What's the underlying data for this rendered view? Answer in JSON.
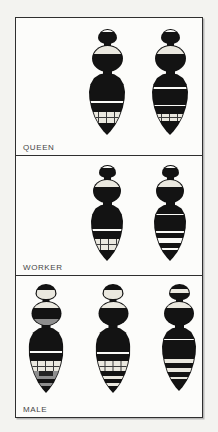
{
  "figure_caption": "Bumblebee caste colour-pattern plate",
  "colors": {
    "page_bg": "#f3f3f0",
    "panel_bg": "#fcfcfa",
    "border": "#2f2f2f",
    "label": "#454545",
    "ink": "#131313",
    "white_band": "#fafaf7",
    "pale_band": "#eae8df",
    "gray_band": "#8e8e8e",
    "grid_line": "#3a3a3a"
  },
  "panels": [
    {
      "label": "QUEEN",
      "bees": [
        {
          "name": "queen-left-bee",
          "cx": 91,
          "top": 11,
          "head": {
            "w": 19,
            "h": 15,
            "bands": [
              [
                "white",
                15
              ],
              [
                "black",
                85
              ]
            ]
          },
          "thorax": {
            "w": 31,
            "h": 27,
            "bands": [
              [
                "pale",
                30
              ],
              [
                "black",
                70
              ]
            ]
          },
          "abdomen": {
            "w": 36,
            "h": 62,
            "bands": [
              [
                "black",
                45
              ],
              [
                "white",
                4
              ],
              [
                "black",
                14
              ],
              [
                "palegrid",
                19
              ],
              [
                "black",
                18
              ]
            ]
          }
        },
        {
          "name": "queen-right-bee",
          "cx": 154,
          "top": 11,
          "head": {
            "w": 19,
            "h": 15,
            "bands": [
              [
                "white",
                16
              ],
              [
                "black",
                84
              ]
            ]
          },
          "thorax": {
            "w": 31,
            "h": 27,
            "bands": [
              [
                "pale",
                30
              ],
              [
                "black",
                70
              ]
            ]
          },
          "abdomen": {
            "w": 36,
            "h": 62,
            "bands": [
              [
                "black",
                22
              ],
              [
                "white",
                3
              ],
              [
                "black",
                26
              ],
              [
                "white",
                3
              ],
              [
                "black",
                12
              ],
              [
                "palegrid",
                13
              ],
              [
                "black",
                21
              ]
            ]
          }
        }
      ]
    },
    {
      "label": "WORKER",
      "bees": [
        {
          "name": "worker-left-bee",
          "cx": 91,
          "top": 9,
          "head": {
            "w": 17,
            "h": 13,
            "bands": [
              [
                "white",
                15
              ],
              [
                "black",
                85
              ]
            ]
          },
          "thorax": {
            "w": 28,
            "h": 24,
            "bands": [
              [
                "pale",
                30
              ],
              [
                "black",
                70
              ]
            ]
          },
          "abdomen": {
            "w": 32,
            "h": 57,
            "bands": [
              [
                "black",
                44
              ],
              [
                "white",
                4
              ],
              [
                "black",
                14
              ],
              [
                "palegrid",
                20
              ],
              [
                "black",
                18
              ]
            ]
          }
        },
        {
          "name": "worker-right-bee",
          "cx": 154,
          "top": 9,
          "head": {
            "w": 17,
            "h": 13,
            "bands": [
              [
                "white",
                16
              ],
              [
                "black",
                84
              ]
            ]
          },
          "thorax": {
            "w": 28,
            "h": 24,
            "bands": [
              [
                "pale",
                30
              ],
              [
                "black",
                70
              ]
            ]
          },
          "abdomen": {
            "w": 32,
            "h": 57,
            "bands": [
              [
                "black",
                16
              ],
              [
                "white",
                3
              ],
              [
                "black",
                29
              ],
              [
                "white",
                3
              ],
              [
                "black",
                9
              ],
              [
                "white",
                9
              ],
              [
                "black",
                9
              ],
              [
                "white",
                4
              ],
              [
                "black",
                18
              ]
            ]
          }
        }
      ]
    },
    {
      "label": "MALE",
      "bees": [
        {
          "name": "male-left-bee",
          "cx": 30,
          "top": 8,
          "head": {
            "w": 21,
            "h": 16,
            "bands": [
              [
                "black",
                38
              ],
              [
                "pale",
                62
              ]
            ]
          },
          "thorax": {
            "w": 30,
            "h": 25,
            "bands": [
              [
                "pale",
                28
              ],
              [
                "black",
                44
              ],
              [
                "gray",
                28
              ]
            ]
          },
          "abdomen": {
            "w": 35,
            "h": 66,
            "bands": [
              [
                "black",
                36
              ],
              [
                "white",
                3
              ],
              [
                "black",
                13
              ],
              [
                "palegrid",
                15
              ],
              [
                "graycenter",
                8
              ],
              [
                "gray",
                5
              ],
              [
                "black",
                6
              ],
              [
                "gray",
                5
              ],
              [
                "black",
                9
              ]
            ]
          }
        },
        {
          "name": "male-middle-bee",
          "cx": 97,
          "top": 8,
          "head": {
            "w": 21,
            "h": 16,
            "bands": [
              [
                "black",
                38
              ],
              [
                "pale",
                62
              ]
            ]
          },
          "thorax": {
            "w": 30,
            "h": 25,
            "bands": [
              [
                "pale",
                28
              ],
              [
                "black",
                72
              ]
            ]
          },
          "abdomen": {
            "w": 35,
            "h": 66,
            "bands": [
              [
                "black",
                37
              ],
              [
                "white",
                3
              ],
              [
                "black",
                11
              ],
              [
                "palegrid",
                16
              ],
              [
                "black",
                8
              ],
              [
                "pale",
                4
              ],
              [
                "black",
                7
              ],
              [
                "pale",
                4
              ],
              [
                "black",
                10
              ]
            ]
          }
        },
        {
          "name": "male-right-bee",
          "cx": 163,
          "top": 8,
          "head": {
            "w": 21,
            "h": 16,
            "bands": [
              [
                "black",
                30
              ],
              [
                "pale",
                28
              ],
              [
                "black",
                42
              ]
            ]
          },
          "thorax": {
            "w": 30,
            "h": 25,
            "bands": [
              [
                "pale",
                28
              ],
              [
                "black",
                72
              ]
            ]
          },
          "abdomen": {
            "w": 34,
            "h": 64,
            "bands": [
              [
                "black",
                17
              ],
              [
                "white",
                3
              ],
              [
                "black",
                30
              ],
              [
                "pale",
                7
              ],
              [
                "black",
                8
              ],
              [
                "pale",
                6
              ],
              [
                "black",
                8
              ],
              [
                "pale",
                4
              ],
              [
                "black",
                17
              ]
            ]
          }
        }
      ]
    }
  ]
}
